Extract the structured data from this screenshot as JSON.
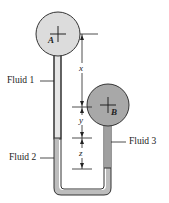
{
  "diagram": {
    "vessels": [
      {
        "id": "A",
        "label": "A",
        "fill": "#dcdcdc"
      },
      {
        "id": "B",
        "label": "B",
        "fill": "#a8a8a8"
      }
    ],
    "fluids": [
      {
        "label": "Fluid 1",
        "fill": "#e6e6e6"
      },
      {
        "label": "Fluid 2",
        "fill": "#bdbdbd"
      },
      {
        "label": "Fluid 3",
        "fill": "#9e9e9e"
      }
    ],
    "dimensions": [
      {
        "label": "x"
      },
      {
        "label": "y"
      },
      {
        "label": "z"
      }
    ]
  }
}
